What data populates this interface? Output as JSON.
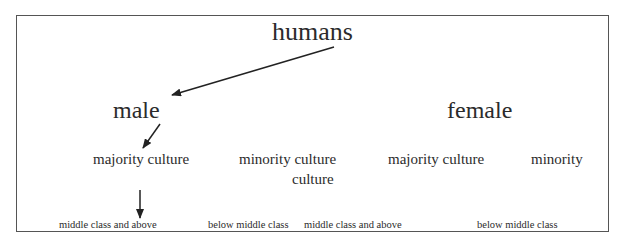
{
  "diagram": {
    "root": {
      "label": "humans"
    },
    "level1": [
      {
        "label": "male"
      },
      {
        "label": "female"
      }
    ],
    "level2": [
      {
        "label": "majority culture",
        "parent": "male"
      },
      {
        "label": "minority culture",
        "continuation": "culture",
        "parent": "male"
      },
      {
        "label": "majority culture",
        "parent": "female"
      },
      {
        "label": "minority",
        "parent": "female"
      }
    ],
    "level3": [
      {
        "label": "middle class and above"
      },
      {
        "label": "below middle class"
      },
      {
        "label": "middle class and above"
      },
      {
        "label": "below middle class"
      }
    ],
    "arrows": [
      {
        "from": "humans",
        "to": "male"
      },
      {
        "from": "male",
        "to": "majority culture"
      },
      {
        "from": "majority culture",
        "to": "middle class and above"
      }
    ],
    "colors": {
      "text": "#2b2b2b",
      "border": "#555555",
      "arrow": "#222222"
    }
  }
}
